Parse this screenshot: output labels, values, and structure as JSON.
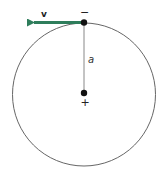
{
  "diagram": {
    "labels": {
      "velocity": "v",
      "acceleration": "a",
      "top_charge": "−",
      "center_charge": "+"
    },
    "colors": {
      "velocity_arrow": "#2e7d5b",
      "circle": "#666666",
      "radius_line": "#888888",
      "dots": "#111111"
    }
  }
}
